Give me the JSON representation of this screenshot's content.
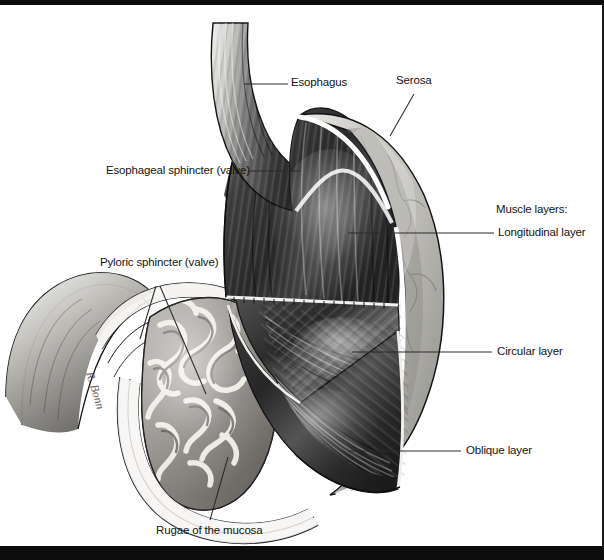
{
  "figure": {
    "style": "grayscale pen-and-ink anatomical illustration",
    "artist_signature": "R. Bonn",
    "frame": {
      "top_band_color": "#0c0c0c",
      "bottom_band_color": "#0c0c0c",
      "background": "#ffffff"
    }
  },
  "labels": [
    {
      "id": "esophagus",
      "text": "Esophagus"
    },
    {
      "id": "serosa",
      "text": "Serosa"
    },
    {
      "id": "esophageal-sphincter",
      "text": "Esophageal sphincter (valve)"
    },
    {
      "id": "pyloric-sphincter",
      "text": "Pyloric sphincter (valve)"
    },
    {
      "id": "muscle-layers",
      "text": "Muscle layers:"
    },
    {
      "id": "longitudinal-layer",
      "text": "Longitudinal layer"
    },
    {
      "id": "circular-layer",
      "text": "Circular layer"
    },
    {
      "id": "oblique-layer",
      "text": "Oblique layer"
    },
    {
      "id": "rugae",
      "text": "Rugae of the mucosa"
    }
  ],
  "palette": {
    "ink": "#141414",
    "leader_line": "#2a2a2a",
    "serosa_light": "#c9c9c6",
    "serosa_mid": "#b0b0ac",
    "muscle_dark": "#2f2f2f",
    "muscle_mid": "#585858",
    "muscle_light": "#8f8f8f",
    "mucosa_light": "#e4e2dd",
    "mucosa_shadow": "#6d6a66",
    "highlight": "#ffffff",
    "outline": "#111111"
  }
}
